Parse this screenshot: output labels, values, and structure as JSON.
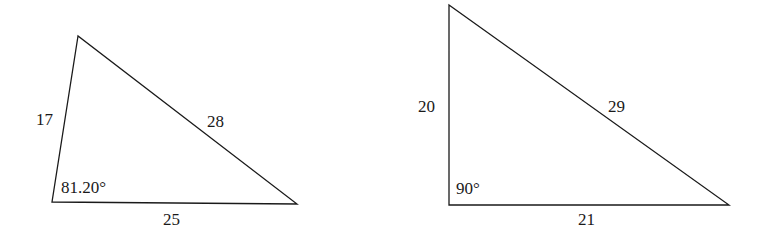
{
  "diagram": {
    "stroke_color": "#1a1a1a",
    "background": "#ffffff",
    "triangles": [
      {
        "id": "left",
        "type": "scalene",
        "vertices": {
          "top": [
            78,
            36
          ],
          "bottom_left": [
            52,
            202
          ],
          "bottom_right": [
            297,
            204
          ]
        },
        "labels": {
          "left_side": "17",
          "hypotenuse_side": "28",
          "base": "25",
          "angle": "81.20°"
        }
      },
      {
        "id": "right",
        "type": "right",
        "vertices": {
          "top": [
            449,
            5
          ],
          "bottom_left": [
            449,
            205
          ],
          "bottom_right": [
            729,
            205
          ]
        },
        "labels": {
          "left_side": "20",
          "hypotenuse_side": "29",
          "base": "21",
          "angle": "90°"
        }
      }
    ]
  }
}
